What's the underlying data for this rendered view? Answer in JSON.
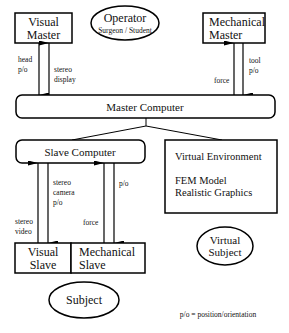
{
  "nodes": {
    "visual_master": {
      "line1": "Visual",
      "line2": "Master"
    },
    "operator": {
      "title": "Operator",
      "subtitle": "Surgeon / Student"
    },
    "mechanical_master": {
      "line1": "Mechanical",
      "line2": "Master"
    },
    "master_computer": {
      "label": "Master Computer"
    },
    "slave_computer": {
      "label": "Slave Computer"
    },
    "virtual_environment": {
      "title": "Virtual Environment",
      "line1": "FEM Model",
      "line2": "Realistic Graphics"
    },
    "visual_slave": {
      "line1": "Visual",
      "line2": "Slave"
    },
    "mechanical_slave": {
      "line1": "Mechanical",
      "line2": "Slave"
    },
    "virtual_subject": {
      "line1": "Virtual",
      "line2": "Subject"
    },
    "subject": {
      "label": "Subject"
    }
  },
  "edges": {
    "head_po": {
      "line1": "head",
      "line2": "p/o"
    },
    "stereo_display": {
      "line1": "stereo",
      "line2": "display"
    },
    "force_master": {
      "label": "force"
    },
    "tool_po": {
      "line1": "tool",
      "line2": "p/o"
    },
    "stereo_video": {
      "line1": "stereo",
      "line2": "video"
    },
    "stereo_camera_po": {
      "line1": "stereo",
      "line2": "camera",
      "line3": "p/o"
    },
    "force_slave": {
      "label": "force"
    },
    "po_slave": {
      "label": "p/o"
    }
  },
  "legend": {
    "text": "p/o = position/orientation"
  }
}
